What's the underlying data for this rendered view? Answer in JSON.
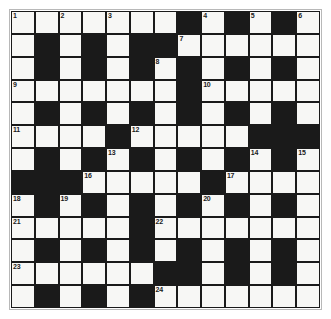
{
  "puzzle": {
    "type": "crossword-grid",
    "rows": 13,
    "columns": 13,
    "colors": {
      "block": "#1a1a1a",
      "open_cell": "#f7f7f5",
      "frame": "#b8b8b8",
      "number_text": "#1a1a1a",
      "page_background": "#ffffff"
    },
    "legend": {
      "white_code": "W",
      "black_code": "B"
    },
    "grid": [
      [
        "W",
        "W",
        "W",
        "W",
        "W",
        "W",
        "W",
        "B",
        "W",
        "B",
        "W",
        "B",
        "W"
      ],
      [
        "W",
        "B",
        "W",
        "B",
        "W",
        "B",
        "B",
        "W",
        "W",
        "W",
        "W",
        "W",
        "W"
      ],
      [
        "W",
        "B",
        "W",
        "B",
        "W",
        "B",
        "W",
        "B",
        "W",
        "B",
        "W",
        "B",
        "W"
      ],
      [
        "W",
        "W",
        "W",
        "W",
        "W",
        "W",
        "W",
        "B",
        "W",
        "W",
        "W",
        "W",
        "W"
      ],
      [
        "W",
        "B",
        "W",
        "B",
        "W",
        "B",
        "W",
        "B",
        "W",
        "B",
        "W",
        "B",
        "W"
      ],
      [
        "W",
        "W",
        "W",
        "W",
        "B",
        "W",
        "W",
        "W",
        "W",
        "W",
        "B",
        "B",
        "B"
      ],
      [
        "W",
        "B",
        "W",
        "B",
        "W",
        "B",
        "W",
        "B",
        "W",
        "B",
        "W",
        "B",
        "W"
      ],
      [
        "B",
        "B",
        "B",
        "W",
        "W",
        "W",
        "W",
        "W",
        "B",
        "W",
        "W",
        "W",
        "W"
      ],
      [
        "W",
        "B",
        "W",
        "B",
        "W",
        "B",
        "W",
        "B",
        "W",
        "B",
        "W",
        "B",
        "W"
      ],
      [
        "W",
        "W",
        "W",
        "W",
        "W",
        "B",
        "W",
        "W",
        "W",
        "W",
        "W",
        "W",
        "W"
      ],
      [
        "W",
        "B",
        "W",
        "B",
        "W",
        "B",
        "W",
        "B",
        "W",
        "B",
        "W",
        "B",
        "W"
      ],
      [
        "W",
        "W",
        "W",
        "W",
        "W",
        "W",
        "B",
        "B",
        "W",
        "B",
        "W",
        "B",
        "W"
      ],
      [
        "W",
        "B",
        "W",
        "B",
        "W",
        "B",
        "W",
        "W",
        "W",
        "W",
        "W",
        "W",
        "W"
      ]
    ],
    "numbers": [
      {
        "number": "1",
        "row": 0,
        "col": 0
      },
      {
        "number": "2",
        "row": 0,
        "col": 2
      },
      {
        "number": "3",
        "row": 0,
        "col": 4
      },
      {
        "number": "4",
        "row": 0,
        "col": 8
      },
      {
        "number": "5",
        "row": 0,
        "col": 10
      },
      {
        "number": "6",
        "row": 0,
        "col": 12
      },
      {
        "number": "7",
        "row": 1,
        "col": 7
      },
      {
        "number": "8",
        "row": 2,
        "col": 6
      },
      {
        "number": "9",
        "row": 3,
        "col": 0
      },
      {
        "number": "10",
        "row": 3,
        "col": 8
      },
      {
        "number": "11",
        "row": 5,
        "col": 0
      },
      {
        "number": "12",
        "row": 5,
        "col": 5
      },
      {
        "number": "13",
        "row": 6,
        "col": 4
      },
      {
        "number": "14",
        "row": 6,
        "col": 10
      },
      {
        "number": "15",
        "row": 6,
        "col": 12
      },
      {
        "number": "16",
        "row": 7,
        "col": 3
      },
      {
        "number": "17",
        "row": 7,
        "col": 9
      },
      {
        "number": "18",
        "row": 8,
        "col": 0
      },
      {
        "number": "19",
        "row": 8,
        "col": 2
      },
      {
        "number": "20",
        "row": 8,
        "col": 8
      },
      {
        "number": "21",
        "row": 9,
        "col": 0
      },
      {
        "number": "22",
        "row": 9,
        "col": 6
      },
      {
        "number": "23",
        "row": 11,
        "col": 0
      },
      {
        "number": "24",
        "row": 12,
        "col": 6
      }
    ]
  }
}
